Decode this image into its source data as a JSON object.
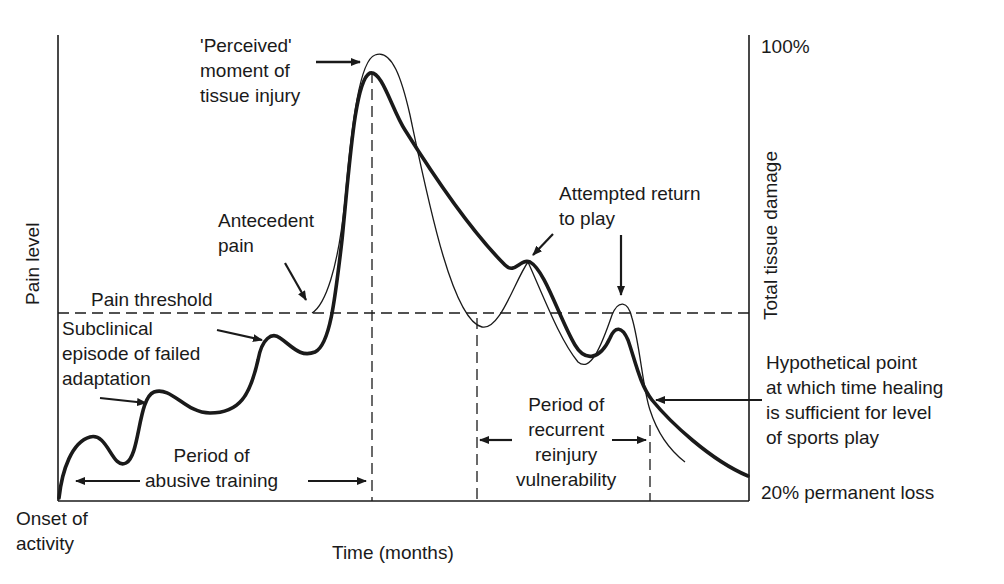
{
  "diagram": {
    "axes": {
      "y_left_label": "Pain level",
      "y_right_label": "Total tissue damage",
      "x_label": "Time (months)",
      "y_right_top": "100%",
      "y_right_bottom": "20% permanent loss",
      "origin_label": "Onset of\nactivity"
    },
    "threshold": {
      "label": "Pain threshold"
    },
    "annotations": {
      "perceived_injury": "'Perceived'\nmoment of\ntissue injury",
      "antecedent_pain": "Antecedent\npain",
      "subclinical": "Subclinical\nepisode of failed\nadaptation",
      "attempted_return": "Attempted return\nto play",
      "hypothetical_point": "Hypothetical point\nat which time healing\nis sufficient for level\nof sports play",
      "abusive_training": "Period of\nabusive training",
      "recurrent_reinjury": "Period of\nrecurrent\nreinjury\nvulnerability"
    },
    "series": [
      {
        "name": "Pain level",
        "style": "thin line"
      },
      {
        "name": "Total tissue damage",
        "style": "thick line"
      }
    ],
    "colors": {
      "ink": "#1a1a1a",
      "background": "#ffffff"
    }
  }
}
